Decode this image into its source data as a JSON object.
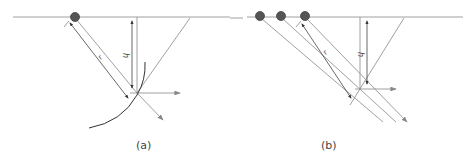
{
  "panels": [
    {
      "id": "a",
      "caption": "(a)",
      "labels": {
        "h": "h",
        "r": "r"
      }
    },
    {
      "id": "b",
      "caption": "(b)",
      "labels": {
        "h": "h",
        "r": "r"
      }
    }
  ],
  "colors": {
    "line": "#888888",
    "dark": "#333333",
    "source": "#555555"
  }
}
